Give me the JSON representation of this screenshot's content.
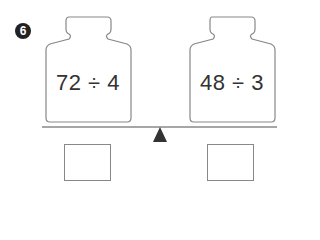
{
  "problem": {
    "number": "6",
    "left_weight": {
      "expression": "72 ÷ 4"
    },
    "right_weight": {
      "expression": "48 ÷ 3"
    },
    "answer_boxes": [
      {
        "value": ""
      },
      {
        "value": ""
      }
    ]
  },
  "colors": {
    "outline": "#888888",
    "text": "#333333",
    "fulcrum": "#333333",
    "badge": "#222222"
  }
}
